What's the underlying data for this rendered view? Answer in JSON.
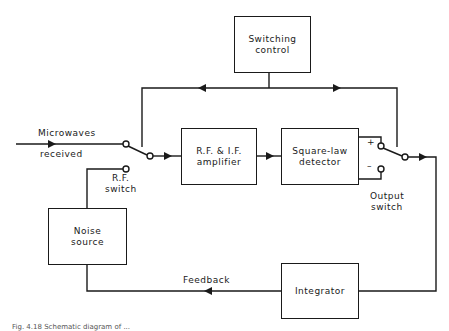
{
  "diagram": {
    "blocks": {
      "switching_control": {
        "line1": "Switching",
        "line2": "control"
      },
      "rf_if_amplifier": {
        "line1": "R.F. & I.F.",
        "line2": "amplifier"
      },
      "square_law_detector": {
        "line1": "Square-law",
        "line2": "detector"
      },
      "noise_source": {
        "line1": "Noise",
        "line2": "source"
      },
      "integrator": {
        "line1": "Integrator"
      }
    },
    "labels": {
      "microwaves": "Microwaves",
      "received": "received",
      "rf_switch_line1": "R.F.",
      "rf_switch_line2": "switch",
      "output_switch_line1": "Output",
      "output_switch_line2": "switch",
      "plus": "+",
      "minus": "–",
      "feedback": "Feedback"
    },
    "caption": "Fig. 4.18 Schematic diagram of ..."
  }
}
